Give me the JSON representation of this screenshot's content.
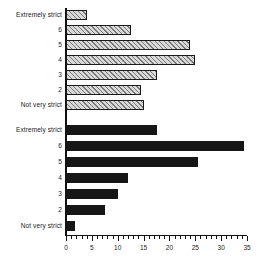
{
  "chart_data": {
    "type": "bar",
    "orientation": "horizontal",
    "title": "",
    "subtitle": "",
    "xlabel": "",
    "ylabel": "",
    "xlim": [
      0,
      35
    ],
    "ylim": null,
    "grid": false,
    "legend": null,
    "xticks": [
      0,
      5,
      10,
      15,
      20,
      25,
      30,
      35
    ],
    "xtick_labels": [
      "0",
      "5",
      "10",
      "15",
      "20",
      "25",
      "30",
      "35"
    ],
    "minor_tick_step": 1,
    "categories": [
      "Extremely strict",
      "6",
      "5",
      "4",
      "3",
      "2",
      "Not very strict"
    ],
    "series": [
      {
        "name": "group-1",
        "style": "hatched",
        "color": "#d9d9d9",
        "values": [
          4,
          12.5,
          24,
          25,
          17.5,
          14.5,
          15
        ]
      },
      {
        "name": "group-2",
        "style": "solid",
        "color": "#161616",
        "values": [
          17.5,
          34.5,
          25.5,
          12,
          10,
          7.5,
          1.7
        ]
      }
    ],
    "annotations": []
  },
  "axis": {
    "top_group_labels": [
      "Extremely strict",
      "6",
      "5",
      "4",
      "3",
      "2",
      "Not very strict"
    ],
    "bottom_group_labels": [
      "Extremely strict",
      "6",
      "5",
      "4",
      "3",
      "2",
      "Not very strict"
    ],
    "x_labels": [
      "0",
      "5",
      "10",
      "15",
      "20",
      "25",
      "30",
      "35"
    ]
  }
}
